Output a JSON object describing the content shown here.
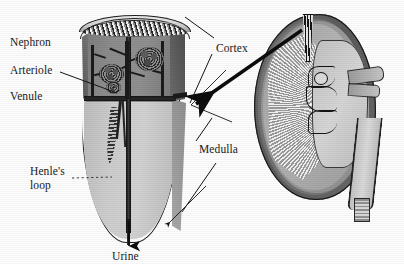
{
  "figure": {
    "type": "anatomical-diagram",
    "background_color": "#fefefe",
    "ink_color": "#1a1a1a"
  },
  "labels": {
    "nephron": "Nephron",
    "arteriole": "Arteriole",
    "venule": "Venule",
    "henles_loop": "Henle's\nloop",
    "henles_loop_line1": "Henle's",
    "henles_loop_line2": "loop",
    "cortex": "Cortex",
    "medulla": "Medulla",
    "urine": "Urine"
  },
  "magnified_wedge": {
    "name": "kidney-tissue-wedge",
    "regions": [
      {
        "name": "renal-capsule",
        "tone": "#9a9a9a",
        "texture": "speckled-band"
      },
      {
        "name": "cortex",
        "tone": "#8a8a8a",
        "contains": [
          "glomeruli",
          "arterioles",
          "venules"
        ]
      },
      {
        "name": "cortex-medulla-boundary",
        "tone": "#141414"
      },
      {
        "name": "medulla",
        "tone": "#c9c9c9",
        "contains": [
          "henle-loop",
          "collecting-duct"
        ]
      }
    ],
    "structures": [
      {
        "name": "glomerulus-left"
      },
      {
        "name": "glomerulus-right"
      },
      {
        "name": "glomerulus-lower"
      },
      {
        "name": "collecting-duct"
      },
      {
        "name": "loop-of-henle"
      }
    ]
  },
  "whole_kidney": {
    "name": "kidney-cross-section",
    "parts": [
      {
        "name": "renal-capsule",
        "tone": "#6a6a6a"
      },
      {
        "name": "renal-cortex",
        "tone": "#a8a8a8"
      },
      {
        "name": "medullary-pyramids",
        "tone": "#b0b0b0",
        "texture": "striated"
      },
      {
        "name": "renal-pelvis",
        "tone": "#cfcfcf"
      },
      {
        "name": "renal-calyces",
        "tone": "#141414"
      },
      {
        "name": "renal-artery-vein",
        "tone": "#b6b6b6"
      },
      {
        "name": "ureter",
        "tone": "#c8c8c8"
      },
      {
        "name": "sample-wedge-region",
        "tone": "#141414"
      }
    ]
  },
  "annotations": {
    "magnification_arrow": {
      "name": "magnification-arrow",
      "description": "Thick arrow from sample wedge in kidney to magnified wedge",
      "direction": "right-to-left"
    },
    "leader_lines": [
      {
        "from": "arteriole",
        "to": "cortex-vessel"
      },
      {
        "from": "henles-loop",
        "to": "medulla-tubule",
        "style": "dotted"
      },
      {
        "from": "cortex",
        "to": "wedge-cortex-top"
      },
      {
        "from": "cortex",
        "to": "wedge-cortex-face"
      },
      {
        "from": "medulla",
        "to": "wedge-medulla-upper"
      },
      {
        "from": "medulla",
        "to": "wedge-medulla-lower"
      },
      {
        "from": "urine",
        "to": "collecting-duct-outlet",
        "style": "arrow"
      }
    ]
  }
}
